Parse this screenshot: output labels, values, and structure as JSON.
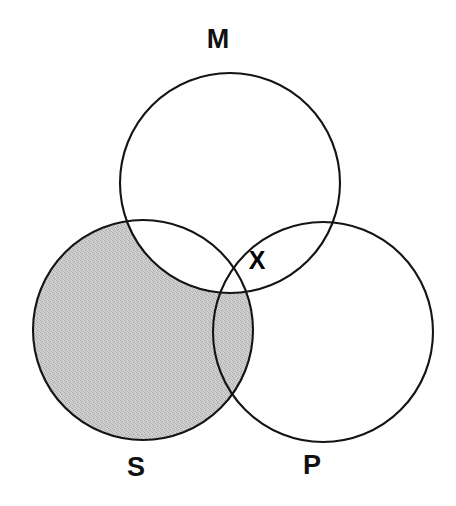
{
  "diagram": {
    "type": "venn-three-circle",
    "title": "",
    "background_color": "#ffffff",
    "stroke_color": "#141414",
    "shade_color": "#c2c2c2",
    "canvas": {
      "width": 456,
      "height": 506
    },
    "circles": [
      {
        "id": "M",
        "label": "M",
        "label_position": {
          "x": 218,
          "y": 41
        },
        "center": {
          "x": 230,
          "y": 183
        },
        "radius": 110,
        "filled": false
      },
      {
        "id": "S",
        "label": "S",
        "label_position": {
          "x": 136,
          "y": 469
        },
        "center": {
          "x": 143,
          "y": 330
        },
        "radius": 110,
        "filled": true
      },
      {
        "id": "P",
        "label": "P",
        "label_position": {
          "x": 312,
          "y": 467
        },
        "center": {
          "x": 323,
          "y": 332
        },
        "radius": 110,
        "filled": false
      }
    ],
    "shaded_region": {
      "description": "S minus M",
      "sets_included": [
        "S"
      ],
      "sets_excluded": [
        "M"
      ],
      "color": "#c2c2c2"
    },
    "marks": [
      {
        "id": "x-mark",
        "symbol": "X",
        "position": {
          "x": 257,
          "y": 262
        },
        "region": "M and P, not S"
      }
    ]
  }
}
